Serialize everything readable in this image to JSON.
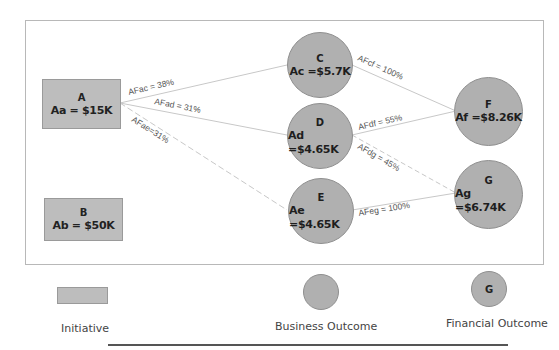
{
  "diagram": {
    "nodes": {
      "A": {
        "id": "A",
        "value": "Aa = $15K",
        "type": "Initiative"
      },
      "B": {
        "id": "B",
        "value": "Ab = $50K",
        "type": "Initiative"
      },
      "C": {
        "id": "C",
        "value": "Ac =$5.7K",
        "type": "Business Outcome"
      },
      "D": {
        "id": "D",
        "value": "Ad =$4.65K",
        "type": "Business Outcome"
      },
      "E": {
        "id": "E",
        "value": "Ae =$4.65K",
        "type": "Business Outcome"
      },
      "F": {
        "id": "F",
        "value": "Af =$8.26K",
        "type": "Financial Outcome"
      },
      "G": {
        "id": "G",
        "value": "Ag =$6.74K",
        "type": "Financial Outcome"
      }
    },
    "edges": [
      {
        "from": "A",
        "to": "C",
        "label": "AFac = 38%"
      },
      {
        "from": "A",
        "to": "D",
        "label": "AFad = 31%"
      },
      {
        "from": "A",
        "to": "E",
        "label": "AFae=31%"
      },
      {
        "from": "C",
        "to": "F",
        "label": "AFcf = 100%"
      },
      {
        "from": "D",
        "to": "F",
        "label": "AFdf = 55%"
      },
      {
        "from": "D",
        "to": "G",
        "label": "AFdg = 45%"
      },
      {
        "from": "E",
        "to": "G",
        "label": "AFeg = 100%"
      }
    ]
  },
  "legend": {
    "initiative": {
      "label": "Initiative"
    },
    "business_outcome": {
      "label": "Business Outcome"
    },
    "financial_outcome": {
      "label": "Financial Outcome",
      "sample_text": "G"
    }
  },
  "colors": {
    "node_fill": "#b0b0b0",
    "initiative_fill": "#bdbdbd",
    "edge": "#c8c8c8",
    "frame_border": "#b8b8b8"
  }
}
